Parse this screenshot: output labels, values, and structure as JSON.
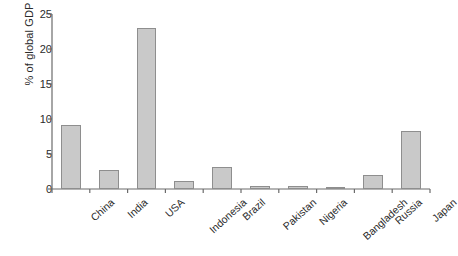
{
  "chart_data": {
    "type": "bar",
    "title": "",
    "subtitle": "",
    "xlabel": "",
    "ylabel": "% of global GDP",
    "categories": [
      "China",
      "India",
      "USA",
      "Indonesia",
      "Brazil",
      "Pakistan",
      "Nigeria",
      "Bangladesh",
      "Russia",
      "Japan"
    ],
    "values": [
      9.2,
      2.7,
      23.0,
      1.1,
      3.1,
      0.4,
      0.4,
      0.2,
      2.0,
      8.3
    ],
    "ylim": [
      0,
      25
    ],
    "yticks": [
      0,
      5,
      10,
      15,
      20,
      25
    ],
    "ytick_labels": [
      "0",
      "5",
      "10",
      "15",
      "20",
      "25"
    ],
    "grid": false,
    "legend": null,
    "legend_position": "none",
    "annotations": [],
    "bar_fill_color": "#c9c9c9",
    "bar_edge_color": "#8e8e8e",
    "axis_color": "#6b6b6b",
    "text_color": "#2b2b2b",
    "background_color": "#ffffff",
    "xtick_rotation_degrees": -42
  }
}
